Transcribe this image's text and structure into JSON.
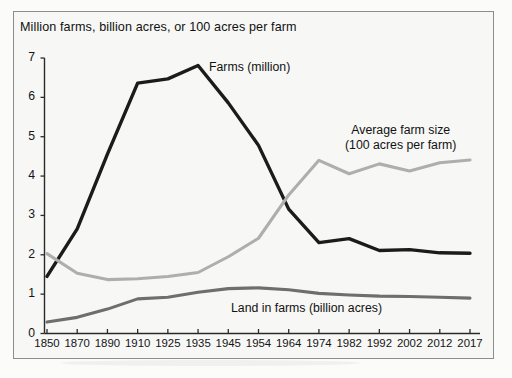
{
  "figure": {
    "title": "Million farms, billion acres, or 100 acres per farm",
    "frame_color": "#8d8d8d",
    "background": "#f7f7f5"
  },
  "annotations": {
    "farms": "Farms (million)",
    "avg_farm_size_line1": "Average farm size",
    "avg_farm_size_line2": "(100 acres per farm)",
    "land_in_farms": "Land in farms (billion acres)"
  },
  "chart_data": {
    "type": "line",
    "title": "Million farms, billion acres, or 100 acres per farm",
    "xlabel": "",
    "ylabel": "",
    "ylim": [
      0,
      7
    ],
    "yticks": [
      0,
      1,
      2,
      3,
      4,
      5,
      6,
      7
    ],
    "grid": false,
    "legend_position": "inline-annotations",
    "categories": [
      "1850",
      "1870",
      "1890",
      "1910",
      "1925",
      "1935",
      "1945",
      "1954",
      "1964",
      "1974",
      "1982",
      "1992",
      "2002",
      "2012",
      "2017"
    ],
    "series": [
      {
        "name": "Farms (million)",
        "color": "#1b1b1b",
        "width": 3.4,
        "values": [
          1.45,
          2.66,
          4.56,
          6.36,
          6.47,
          6.81,
          5.86,
          4.78,
          3.16,
          2.31,
          2.41,
          2.11,
          2.13,
          2.05,
          2.04
        ]
      },
      {
        "name": "Average farm size (100 acres per farm)",
        "color": "#aeaeae",
        "width": 3.1,
        "values": [
          2.03,
          1.53,
          1.37,
          1.39,
          1.45,
          1.55,
          1.95,
          2.42,
          3.52,
          4.4,
          4.06,
          4.31,
          4.13,
          4.34,
          4.41
        ]
      },
      {
        "name": "Land in farms (billion acres)",
        "color": "#6e6e6e",
        "width": 3.1,
        "values": [
          0.29,
          0.41,
          0.62,
          0.88,
          0.92,
          1.05,
          1.14,
          1.16,
          1.11,
          1.02,
          0.98,
          0.95,
          0.94,
          0.92,
          0.9
        ]
      }
    ]
  },
  "axes": {
    "y_tick_labels": [
      "0",
      "1",
      "2",
      "3",
      "4",
      "5",
      "6",
      "7"
    ],
    "x_tick_labels": [
      "1850",
      "1870",
      "1890",
      "1910",
      "1925",
      "1935",
      "1945",
      "1954",
      "1964",
      "1974",
      "1982",
      "1992",
      "2002",
      "2012",
      "2017"
    ]
  }
}
